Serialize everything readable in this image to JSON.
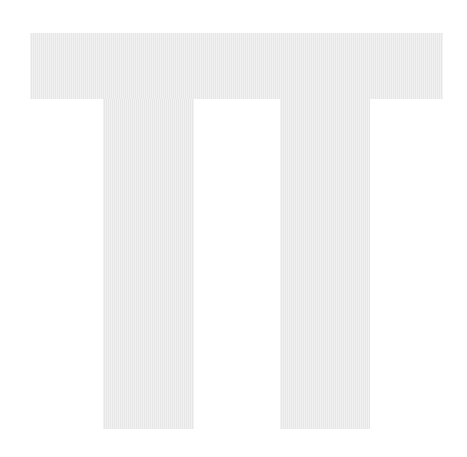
{
  "figure": {
    "glyph": "Π",
    "fill_color": "#ebebeb",
    "background_color": "#ffffff"
  }
}
